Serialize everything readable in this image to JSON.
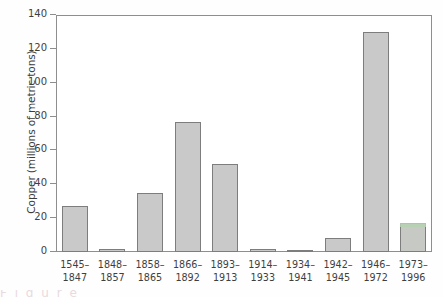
{
  "chart_data": {
    "type": "bar",
    "title": "",
    "xlabel": "",
    "ylabel": "Copper (millions of metric tons)",
    "ylim": [
      0,
      140
    ],
    "yticks": [
      "0",
      "20",
      "40",
      "60",
      "80",
      "100",
      "120",
      "140"
    ],
    "grid": false,
    "legend": null,
    "bar_color": "#c9c9c9",
    "bar_edge_color": "#7d7d7d",
    "categories": [
      "1545-1847",
      "1848-1857",
      "1858-1865",
      "1866-1892",
      "1893-1913",
      "1914-1933",
      "1934-1941",
      "1942-1945",
      "1946-1972",
      "1973-1996"
    ],
    "category_lines": [
      {
        "line1": "1545–",
        "line2": "1847"
      },
      {
        "line1": "1848–",
        "line2": "1857"
      },
      {
        "line1": "1858–",
        "line2": "1865"
      },
      {
        "line1": "1866–",
        "line2": "1892"
      },
      {
        "line1": "1893–",
        "line2": "1913"
      },
      {
        "line1": "1914–",
        "line2": "1933"
      },
      {
        "line1": "1934–",
        "line2": "1941"
      },
      {
        "line1": "1942–",
        "line2": "1945"
      },
      {
        "line1": "1946–",
        "line2": "1972"
      },
      {
        "line1": "1973–",
        "line2": "1996"
      }
    ],
    "values": [
      27,
      2,
      35,
      77,
      52,
      2,
      1,
      8,
      130,
      17
    ]
  },
  "artifact": {
    "bottom_text": "F i g u r e"
  }
}
